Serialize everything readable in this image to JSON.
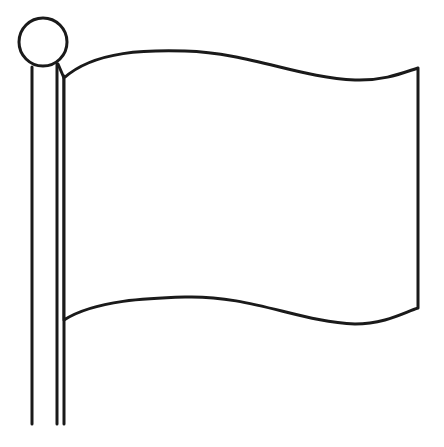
{
  "image": {
    "subject": "blank waving flag outline",
    "colors": {
      "line": "#1a1a1a",
      "background": "#ffffff",
      "flag_fill": "#ffffff"
    }
  }
}
